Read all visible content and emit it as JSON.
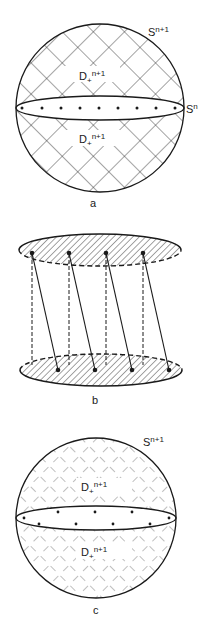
{
  "figure_a": {
    "label": "a",
    "sphere_label": "S",
    "sphere_sup": "n+1",
    "equator_label": "S",
    "equator_sup": "n",
    "upper_disk_label": "D",
    "upper_disk_sub": "+",
    "upper_disk_sup": "n+1",
    "lower_disk_label": "D",
    "lower_disk_sub": "+",
    "lower_disk_sup": "n+1"
  },
  "figure_b": {
    "label": "b"
  },
  "figure_c": {
    "label": "c",
    "sphere_label": "S",
    "sphere_sup": "n+1",
    "upper_disk_label": "D",
    "upper_disk_sub": "+",
    "upper_disk_sup": "n+1",
    "lower_disk_label": "D",
    "lower_disk_sub": "+",
    "lower_disk_sup": "n+1"
  },
  "colors": {
    "ink": "#1a1a1a",
    "background": "#ffffff"
  }
}
